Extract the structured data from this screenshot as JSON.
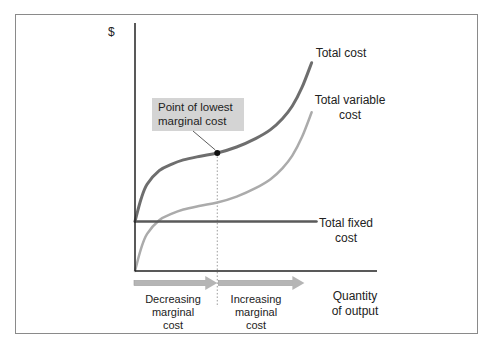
{
  "chart_data": {
    "type": "line",
    "title": "",
    "xlabel": "Quantity of output",
    "xlabel_lines": [
      "Quantity",
      "of output"
    ],
    "ylabel": "$",
    "xlim": [
      0,
      10
    ],
    "ylim": [
      0,
      100
    ],
    "grid": false,
    "series": [
      {
        "name": "Total cost",
        "label_lines": [
          "Total cost"
        ],
        "color": "#6e6e6e",
        "x": [
          0,
          0.25,
          0.5,
          1,
          1.5,
          2,
          2.7,
          3.4,
          4.2,
          5,
          5.6,
          6.1,
          6.5,
          6.9,
          7.3
        ],
        "y": [
          20,
          29,
          35,
          40.5,
          43,
          44.8,
          46.3,
          47.6,
          50,
          53.5,
          57,
          61.5,
          66.5,
          74,
          84
        ]
      },
      {
        "name": "Total variable cost",
        "label_lines": [
          "Total variable",
          "cost"
        ],
        "color": "#ababab",
        "x": [
          0,
          0.25,
          0.5,
          1,
          1.5,
          2,
          2.7,
          3.4,
          4.2,
          5,
          5.6,
          6.1,
          6.5,
          6.9,
          7.3
        ],
        "y": [
          0,
          9,
          15,
          20.5,
          23,
          24.8,
          26.3,
          27.6,
          30,
          33.5,
          37,
          41.5,
          46.5,
          54,
          64
        ]
      },
      {
        "name": "Total fixed cost",
        "label_lines": [
          "Total fixed",
          "cost"
        ],
        "color": "#5a5a5a",
        "x": [
          0,
          7.5
        ],
        "y": [
          20,
          20
        ]
      }
    ],
    "annotations": [
      {
        "type": "point-callout",
        "text_lines": [
          "Point of lowest",
          "marginal cost"
        ],
        "x": 3.4,
        "y": 47.6,
        "box_color": "#d4d4d4",
        "vertical_dotted_line": true
      }
    ],
    "regions": [
      {
        "text_lines": [
          "Decreasing",
          "marginal",
          "cost"
        ],
        "x_from": 0,
        "x_to": 3.4,
        "arrow_color": "#b5b5b5"
      },
      {
        "text_lines": [
          "Increasing",
          "marginal",
          "cost"
        ],
        "x_from": 3.4,
        "x_to": 7.0,
        "arrow_color": "#b5b5b5"
      }
    ]
  }
}
